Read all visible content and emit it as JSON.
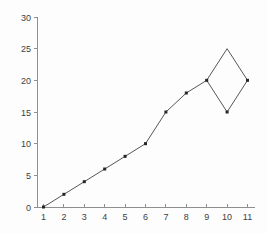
{
  "chart_data": {
    "type": "line",
    "title": "",
    "xlabel": "",
    "ylabel": "",
    "xlim": [
      1,
      11
    ],
    "ylim": [
      0,
      30
    ],
    "x_ticks": [
      1,
      2,
      3,
      4,
      5,
      6,
      7,
      8,
      9,
      10,
      11
    ],
    "y_ticks": [
      0,
      5,
      10,
      15,
      20,
      25,
      30
    ],
    "grid": false,
    "legend_position": "none",
    "series": [
      {
        "name": "series-1",
        "path_points": [
          [
            1,
            0
          ],
          [
            2,
            2
          ],
          [
            3,
            4
          ],
          [
            4,
            6
          ],
          [
            5,
            8
          ],
          [
            6,
            10
          ],
          [
            7,
            15
          ],
          [
            8,
            18
          ],
          [
            9,
            20
          ],
          [
            10,
            25
          ],
          [
            11,
            20
          ],
          [
            10,
            15
          ],
          [
            9,
            20
          ]
        ],
        "marker_points": [
          [
            1,
            0
          ],
          [
            2,
            2
          ],
          [
            3,
            4
          ],
          [
            4,
            6
          ],
          [
            5,
            8
          ],
          [
            6,
            10
          ],
          [
            7,
            15
          ],
          [
            8,
            18
          ],
          [
            9,
            20
          ],
          [
            11,
            20
          ],
          [
            10,
            15
          ]
        ],
        "marker_shape": "square",
        "line_color": "#565656",
        "marker_color": "#262626"
      }
    ],
    "colors": {
      "axis": "#8f8f8f",
      "tick": "#8f8f8f",
      "tick_label": "#404040",
      "background": "#fdfdfd"
    }
  }
}
